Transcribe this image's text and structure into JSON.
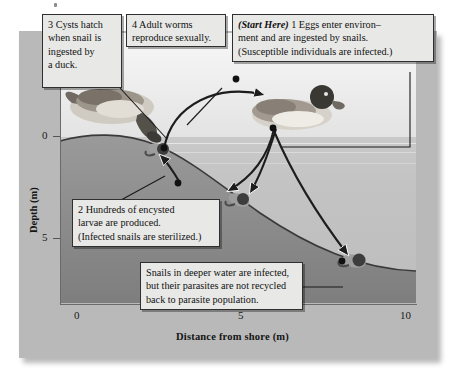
{
  "figure": {
    "type": "life-cycle cross-section diagram"
  },
  "axes": {
    "x": {
      "label": "Distance from shore (m)",
      "ticks": [
        "0",
        "5",
        "10"
      ],
      "tick_values": [
        0,
        5,
        10
      ],
      "range": [
        0,
        10.6
      ]
    },
    "y": {
      "label": "Depth (m)",
      "ticks": [
        "0",
        "5"
      ],
      "tick_values": [
        0,
        5
      ],
      "range": [
        0,
        12
      ]
    }
  },
  "callouts": [
    {
      "id": "step-3",
      "number": "3",
      "text": "Cysts hatch when snail is ingested by a duck.",
      "line1": "3  Cysts hatch",
      "line2": "when snail is",
      "line3": "ingested by",
      "line4": "a duck."
    },
    {
      "id": "step-4",
      "number": "4",
      "text": "Adult worms reproduce sexually.",
      "line1": "4  Adult worms",
      "line2": "reproduce sexually."
    },
    {
      "id": "step-1",
      "number": "1",
      "prefix": "(Start Here)",
      "text": "Eggs enter environ–ment and are ingested by snails. (Susceptible individuals are infected.)",
      "line1_prefix": "(Start Here)",
      "line1": "1  Eggs enter environ–",
      "line2": "ment and are ingested by snails.",
      "line3": "(Susceptible individuals are infected.)"
    },
    {
      "id": "step-2",
      "number": "2",
      "text": "Hundreds of encysted larvae are produced. (Infected snails are sterilized.)",
      "line1": "2  Hundreds of encysted",
      "line2": "larvae are produced.",
      "line3": "(Infected snails are sterilized.)"
    },
    {
      "id": "deep-water-note",
      "text": "Snails in deeper water are infected, but their parasites are not recycled back to parasite population.",
      "line1": "Snails in deeper water are infected,",
      "line2": "but their parasites are not recycled",
      "line3": "back to parasite population."
    }
  ],
  "organisms": [
    {
      "name": "duck-left",
      "label": "Duck at shoreline ingesting snail"
    },
    {
      "name": "duck-right",
      "label": "Duck on water shedding eggs"
    },
    {
      "name": "snail-shallow",
      "label": "Snail at shoreline"
    },
    {
      "name": "snail-mid",
      "label": "Snail on mid slope"
    },
    {
      "name": "snail-deep",
      "label": "Snail in deep water"
    }
  ],
  "colors": {
    "plate": "#b9b9b9",
    "sky": "#f0f0f0",
    "water": "#c5c5c5",
    "sediment": "#8e8e8e",
    "callout_fill": "#e8e8e6",
    "callout_border": "#2f2f2f",
    "text": "#111111"
  }
}
